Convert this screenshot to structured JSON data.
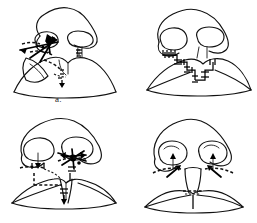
{
  "figure": {
    "background_color": "#ffffff",
    "ink_color": "#111111",
    "style": "black-and-white line drawing",
    "panel_count": 4,
    "panels": [
      {
        "id": "a",
        "label": "a.",
        "caption_text": "a.",
        "view": "basal (worm's eye) view of nose and upper lip",
        "side": "left-sided unilateral cleft",
        "features": [
          "nasal dorsum and alar outline",
          "left nostril (narrow, displaced)",
          "right nostril (oval, intact)",
          "columella deviated to right",
          "cleft through left lip and nostril sill",
          "dashed incision markings",
          "directional arrows at cleft margin",
          "vermilion border line"
        ],
        "annotation_types": [
          "dashed-incision-line",
          "arrow",
          "suture-tick"
        ]
      },
      {
        "id": "b",
        "label": "b.",
        "caption_text": "b.",
        "view": "basal view after closure",
        "side": "left-sided unilateral cleft, repaired",
        "features": [
          "nasal dorsum and alar outline",
          "left nostril (narrow)",
          "right nostril (oval)",
          "stair-step Z-plasty suture line across lip",
          "cross-hatch suture ticks along closure",
          "restored nostril sill",
          "cupid's bow reconstructed"
        ],
        "annotation_types": [
          "suture-line",
          "suture-tick"
        ]
      },
      {
        "id": "c",
        "label": "c.",
        "caption_text": "c.",
        "view": "basal view, bilateral markings",
        "side": "bilateral / wide cleft variant",
        "features": [
          "nasal dorsum and alar outline",
          "left nostril with arrow marking",
          "right nostril with dense marking cluster",
          "bilateral dashed incision lines across nostril sills",
          "central prolabial segment outlined",
          "dashed transverse line across lip",
          "arrows indicating tissue advancement"
        ],
        "annotation_types": [
          "dashed-incision-line",
          "arrow",
          "suture-tick"
        ]
      },
      {
        "id": "d",
        "label": "d.",
        "caption_text": "d.",
        "view": "basal view, symmetric result",
        "side": "bilateral, symmetric",
        "features": [
          "nasal dorsum and alar outline",
          "symmetric left and right nostrils",
          "bilateral arrows pointing into each nostril",
          "bilateral dashed alar base incisions",
          "central columella base outlined",
          "dashed horizontal line at lip closure",
          "symmetric vermilion with central suture"
        ],
        "annotation_types": [
          "dashed-incision-line",
          "arrow",
          "suture-line"
        ]
      }
    ]
  }
}
